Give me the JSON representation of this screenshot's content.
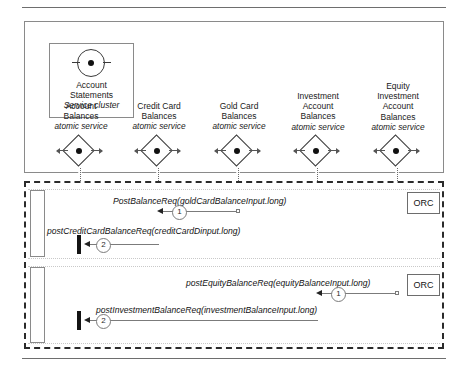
{
  "diagram": {
    "cluster": {
      "name_line1": "Account",
      "name_line2": "Statements",
      "stereotype": "Service cluster",
      "icon": "service-cluster-circle-icon"
    },
    "services": [
      {
        "line1": "Account",
        "line2": "Balances",
        "line3": "",
        "stereotype": "atomic service",
        "x": 80
      },
      {
        "line1": "Credit Card",
        "line2": "Balances",
        "line3": "",
        "stereotype": "atomic service",
        "x": 158
      },
      {
        "line1": "Gold Card",
        "line2": "Balances",
        "line3": "",
        "stereotype": "atomic service",
        "x": 238
      },
      {
        "line1": "Investment",
        "line2": "Account",
        "line3": "Balances",
        "stereotype": "atomic service",
        "x": 317
      },
      {
        "line1": "Equity",
        "line2": "Investment",
        "line3": "Account",
        "line4": "Balances",
        "stereotype": "atomic service",
        "x": 397
      }
    ],
    "messages": [
      {
        "number": "1",
        "label": "PostBalanceReq(goldCardBalanceInput.long)",
        "direction": "right-to-left"
      },
      {
        "number": "2",
        "label": "postCreditCardBalanceReq(creditCardDinput.long)",
        "direction": "right-to-left"
      },
      {
        "number": "1",
        "label": "postEquityBalanceReq(equityBalanceInput.long)",
        "direction": "right-to-left"
      },
      {
        "number": "2",
        "label": "postInvestmentBalanceReq(investmentBalanceInput.long)",
        "direction": "right-to-left"
      }
    ],
    "orchestrators": [
      {
        "label": "ORC"
      },
      {
        "label": "ORC"
      }
    ],
    "colors": {
      "stroke": "#3a3a3a",
      "frame_dashed": "#2b2b2b",
      "lifeline": "#6b6b6b",
      "message": "#7b7b7b",
      "background": "#ffffff"
    }
  }
}
